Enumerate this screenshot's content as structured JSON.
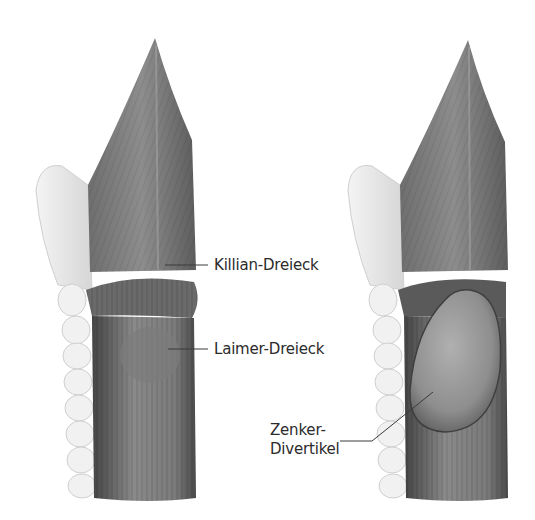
{
  "illustration": {
    "panels": [
      {
        "id": "normal",
        "labels": [
          {
            "text": "Killian-Dreieck"
          },
          {
            "text": "Laimer-Dreieck"
          }
        ]
      },
      {
        "id": "diverticulum",
        "labels": [
          {
            "line1": "Zenker-",
            "line2": "Divertikel"
          }
        ]
      }
    ],
    "colors": {
      "background": "#ffffff",
      "muscle_dark": "#5a5a5a",
      "muscle_mid": "#8a8a8a",
      "cartilage": "#e8e8e8",
      "label_text": "#2b2b2b",
      "leader_line": "#3a3a3a"
    }
  }
}
